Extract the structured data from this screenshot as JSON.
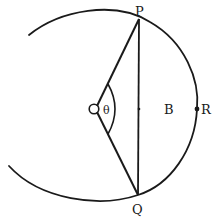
{
  "figure": {
    "type": "geometry-diagram",
    "stroke_color": "#1a1a1a",
    "background": "#ffffff"
  },
  "labels": {
    "P": "P",
    "Q": "Q",
    "O": "O",
    "theta": "θ",
    "B": "B",
    "R": "R"
  },
  "points": {
    "P": {
      "x": 139,
      "y": 19
    },
    "Q": {
      "x": 138,
      "y": 195
    },
    "O": {
      "x": 94,
      "y": 109
    },
    "R": {
      "x": 197,
      "y": 109
    },
    "M": {
      "x": 139,
      "y": 109
    },
    "arc_start": {
      "x": 29,
      "y": 35
    },
    "arc_end": {
      "x": 9,
      "y": 166
    }
  }
}
